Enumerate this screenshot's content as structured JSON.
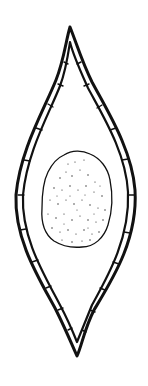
{
  "figure": {
    "type": "scientific line illustration",
    "colors": {
      "background": "#ffffff",
      "ink": "#111111"
    },
    "parts": [
      {
        "name": "outer-wall",
        "description": "double-lined spindle-shaped wall with pointed apices"
      },
      {
        "name": "central-body",
        "description": "irregular rounded stippled mass in the middle"
      }
    ]
  }
}
